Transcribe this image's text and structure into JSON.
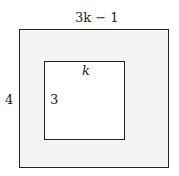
{
  "figure": {
    "outer_shape": {
      "type": "rectangle",
      "top_label": "3k − 1",
      "side_label": "4",
      "fill": "#f4f4f4"
    },
    "inner_shape": {
      "type": "square",
      "top_label": "k",
      "side_label": "3",
      "fill": "#ffffff"
    },
    "stroke_color": "#222222"
  }
}
